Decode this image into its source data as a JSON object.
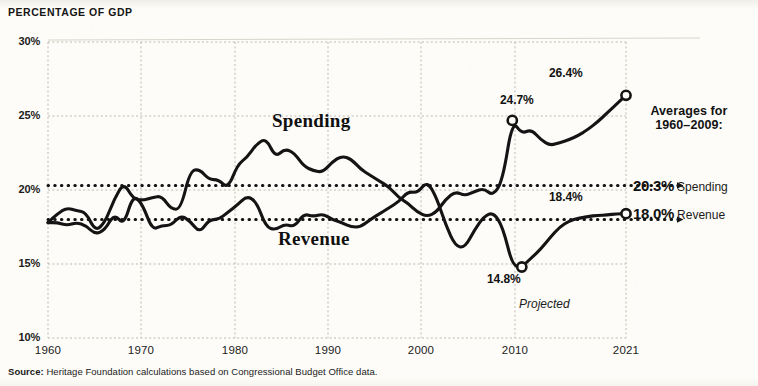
{
  "title": "PERCENTAGE OF GDP",
  "source": {
    "label": "Source:",
    "text": " Heritage Foundation calculations based on Congressional Budget Office data."
  },
  "projected_note": "Projected",
  "legend": {
    "heading_line1": "Averages for",
    "heading_line2": "1960–2009:",
    "rows": [
      {
        "value": "20.3%",
        "name": "Spending",
        "y_value": 20.3
      },
      {
        "value": "18.0%",
        "name": "Revenue",
        "y_value": 18.0
      }
    ]
  },
  "callouts": [
    {
      "id": "spending-2009",
      "text": "24.7%",
      "year": 2009,
      "value": 24.7
    },
    {
      "id": "spending-2021",
      "text": "26.4%",
      "year": 2021,
      "value": 26.4
    },
    {
      "id": "revenue-2010",
      "text": "14.8%",
      "year": 2010,
      "value": 14.8
    },
    {
      "id": "revenue-2021",
      "text": "18.4%",
      "year": 2021,
      "value": 18.4
    }
  ],
  "chart_data": {
    "type": "line",
    "title": "PERCENTAGE OF GDP",
    "xlabel": "",
    "ylabel": "Percentage of GDP",
    "xlim": [
      1960,
      2021
    ],
    "ylim": [
      10,
      30
    ],
    "yticks": [
      10,
      15,
      20,
      25,
      30
    ],
    "ytick_labels": [
      "10%",
      "15%",
      "20%",
      "25%",
      "30%"
    ],
    "xticks": [
      1960,
      1970,
      1980,
      1990,
      2000,
      2010,
      2021
    ],
    "xtick_labels": [
      "1960",
      "1970",
      "1980",
      "1990",
      "2000",
      "2010",
      "2021"
    ],
    "grid": true,
    "legend_position": "right",
    "reference_lines": [
      {
        "label": "20.3% Spending",
        "value": 20.3,
        "style": "dotted"
      },
      {
        "label": "18.0% Revenue",
        "value": 18.0,
        "style": "dotted"
      }
    ],
    "annotations": [
      {
        "text": "Spending",
        "year": 1988,
        "value": 23.6
      },
      {
        "text": "Revenue",
        "year": 1989,
        "value": 16.3
      },
      {
        "text": "Projected",
        "year": 2014,
        "value": 12.2
      },
      {
        "text": "24.7%",
        "year": 2009,
        "value": 24.7
      },
      {
        "text": "26.4%",
        "year": 2021,
        "value": 26.4
      },
      {
        "text": "14.8%",
        "year": 2010,
        "value": 14.8
      },
      {
        "text": "18.4%",
        "year": 2021,
        "value": 18.4
      }
    ],
    "x": [
      1960,
      1961,
      1962,
      1963,
      1964,
      1965,
      1966,
      1967,
      1968,
      1969,
      1970,
      1971,
      1972,
      1973,
      1974,
      1975,
      1976,
      1977,
      1978,
      1979,
      1980,
      1981,
      1982,
      1983,
      1984,
      1985,
      1986,
      1987,
      1988,
      1989,
      1990,
      1991,
      1992,
      1993,
      1994,
      1995,
      1996,
      1997,
      1998,
      1999,
      2000,
      2001,
      2002,
      2003,
      2004,
      2005,
      2006,
      2007,
      2008,
      2009,
      2010,
      2011,
      2012,
      2013,
      2014,
      2015,
      2016,
      2017,
      2018,
      2019,
      2020,
      2021
    ],
    "series": [
      {
        "name": "Spending",
        "marked_points": [
          {
            "year": 2009,
            "value": 24.7
          },
          {
            "year": 2021,
            "value": 26.4
          }
        ],
        "values": [
          17.8,
          18.4,
          18.8,
          18.6,
          18.5,
          17.2,
          17.8,
          19.4,
          20.5,
          19.4,
          19.3,
          19.5,
          19.6,
          18.7,
          18.7,
          21.3,
          21.4,
          20.7,
          20.7,
          20.1,
          21.7,
          22.2,
          23.1,
          23.5,
          22.2,
          22.8,
          22.5,
          21.6,
          21.3,
          21.2,
          21.9,
          22.3,
          22.1,
          21.4,
          21.0,
          20.6,
          20.2,
          19.5,
          19.1,
          18.5,
          18.2,
          18.5,
          19.4,
          19.9,
          19.6,
          19.9,
          20.1,
          19.6,
          20.7,
          24.7,
          23.8,
          24.1,
          23.4,
          23.0,
          23.2,
          23.4,
          23.7,
          24.1,
          24.6,
          25.2,
          25.8,
          26.4
        ]
      },
      {
        "name": "Revenue",
        "marked_points": [
          {
            "year": 2010,
            "value": 14.8
          },
          {
            "year": 2021,
            "value": 18.4
          }
        ],
        "values": [
          17.8,
          17.8,
          17.6,
          17.8,
          17.6,
          17.0,
          17.3,
          18.4,
          17.6,
          19.7,
          19.0,
          17.3,
          17.6,
          17.6,
          18.3,
          17.9,
          17.1,
          18.0,
          18.0,
          18.5,
          19.0,
          19.6,
          19.2,
          17.5,
          17.3,
          17.7,
          17.5,
          18.4,
          18.2,
          18.4,
          18.0,
          17.8,
          17.5,
          17.5,
          18.0,
          18.4,
          18.8,
          19.2,
          19.9,
          19.8,
          20.6,
          19.5,
          17.6,
          16.2,
          16.1,
          17.3,
          18.2,
          18.5,
          17.5,
          14.9,
          14.8,
          15.4,
          16.0,
          16.8,
          17.5,
          17.9,
          18.1,
          18.2,
          18.3,
          18.3,
          18.4,
          18.4
        ]
      }
    ]
  },
  "colors": {
    "ink": "#141414",
    "paper": "#fdfcf8",
    "grid": "#c9c6bb"
  }
}
